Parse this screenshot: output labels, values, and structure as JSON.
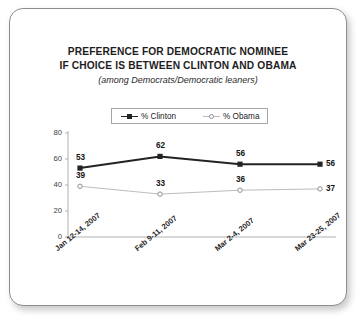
{
  "card": {
    "title_line1": "PREFERENCE FOR DEMOCRATIC NOMINEE",
    "title_line2": "IF CHOICE IS BETWEEN CLINTON AND OBAMA",
    "subtitle": "(among Democrats/Democratic leaners)"
  },
  "legend": {
    "items": [
      {
        "label": "% Clinton",
        "color": "#232323",
        "marker": "filled-square"
      },
      {
        "label": "% Obama",
        "color": "#bdbdbd",
        "marker": "open-circle"
      }
    ]
  },
  "axis": {
    "y_ticks": [
      "0",
      "20",
      "40",
      "60",
      "80"
    ],
    "x_ticks": [
      "Jan 12-14, 2007",
      "Feb 9-11, 2007",
      "Mar 2-4, 2007",
      "Mar 23-25, 2007"
    ]
  },
  "chart_data": {
    "type": "line",
    "title": "PREFERENCE FOR DEMOCRATIC NOMINEE IF CHOICE IS BETWEEN CLINTON AND OBAMA",
    "subtitle": "(among Democrats/Democratic leaners)",
    "xlabel": "",
    "ylabel": "",
    "ylim": [
      0,
      80
    ],
    "ytick_values": [
      0,
      20,
      40,
      60,
      80
    ],
    "grid": false,
    "legend_position": "top-center",
    "categories": [
      "Jan 12-14, 2007",
      "Feb 9-11, 2007",
      "Mar 2-4, 2007",
      "Mar 23-25, 2007"
    ],
    "series": [
      {
        "name": "% Clinton",
        "color": "#232323",
        "marker": "filled-square",
        "values": [
          53,
          62,
          56,
          56
        ]
      },
      {
        "name": "% Obama",
        "color": "#bdbdbd",
        "marker": "open-circle",
        "values": [
          39,
          33,
          36,
          37
        ]
      }
    ]
  }
}
